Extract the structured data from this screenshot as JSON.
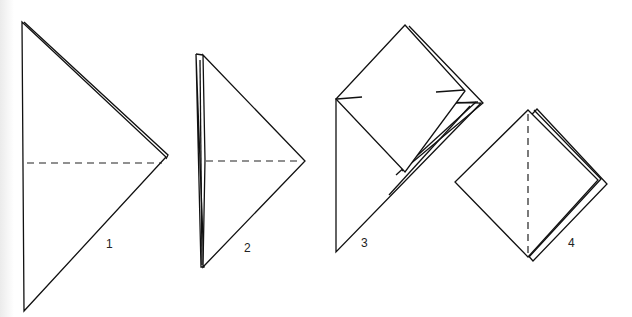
{
  "diagram": {
    "type": "origami folding sequence",
    "steps": [
      {
        "label": "1",
        "shape": "triangle pointing right",
        "fold_line": "horizontal dashed (valley fold)"
      },
      {
        "label": "2",
        "shape": "folded triangle with layered left edge",
        "fold_line": "horizontal dashed (valley fold)"
      },
      {
        "label": "3",
        "shape": "square flap lifted above triangle",
        "fold_line": "none"
      },
      {
        "label": "4",
        "shape": "diamond (square base)",
        "fold_line": "vertical dashed (valley fold)"
      }
    ],
    "line_color": "#111111",
    "background": "#ffffff"
  }
}
